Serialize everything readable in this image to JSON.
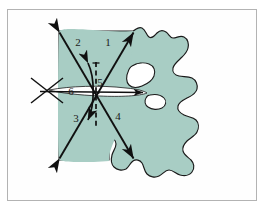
{
  "figure": {
    "frame": {
      "border_color": "#b3b3b3",
      "background": "#fefefe",
      "page_background": "#ffffff"
    },
    "shape": {
      "name": "vertebra-outline",
      "fill_color": "#a8cdc4",
      "stroke_color": "#1a1a1a",
      "foramen_fill": "#ffffff"
    },
    "annotation_style": {
      "line_color": "#101010",
      "dashed_line_color": "#101010",
      "label_color": "#1a1a1a"
    },
    "labels": [
      {
        "id": "label-1",
        "text": "1",
        "x": 108,
        "y": 46,
        "describes": "upper-right diagonal axis"
      },
      {
        "id": "label-2",
        "text": "2",
        "x": 78,
        "y": 46,
        "describes": "upper-left diagonal axis"
      },
      {
        "id": "label-3",
        "text": "3",
        "x": 76,
        "y": 122,
        "describes": "lower-left diagonal axis"
      },
      {
        "id": "label-4",
        "text": "4",
        "x": 118,
        "y": 120,
        "describes": "lower-right diagonal axis"
      },
      {
        "id": "label-5",
        "text": "5",
        "x": 98,
        "y": 86,
        "describes": "vertical dashed reference axis"
      },
      {
        "id": "label-6",
        "text": "6",
        "x": 71,
        "y": 95,
        "describes": "horizontal reference axis"
      }
    ],
    "elements": {
      "diagonal_axis_a": "double-headed arrow from top-left to bottom-right",
      "diagonal_axis_b": "double-headed arrow from bottom-left to top-right",
      "vertical_dashed_axis": "dashed vertical line with tick marks, label 5",
      "horizontal_axis": "horizontal line with arrowhead at right, label 6",
      "angle_arc": "curved double-headed arrow spanning between diagonals",
      "cross_marker": "X-shaped crossing marker at left end of horizontal axis"
    }
  }
}
